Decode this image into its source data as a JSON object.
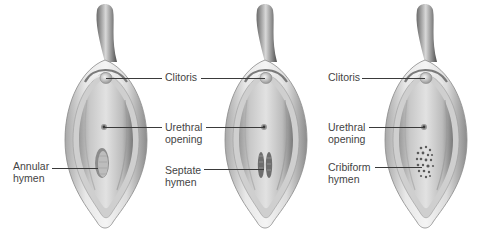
{
  "diagram": {
    "figures": [
      {
        "name": "annular",
        "hymen_type": "Annular hymen",
        "labels": {
          "clitoris": "",
          "urethral_line1": "",
          "urethral_line2": "",
          "hymen_line1": "Annular",
          "hymen_line2": "hymen"
        }
      },
      {
        "name": "septate",
        "hymen_type": "Septate hymen",
        "labels": {
          "clitoris": "Clitoris",
          "urethral_line1": "Urethral",
          "urethral_line2": "opening",
          "hymen_line1": "Septate",
          "hymen_line2": "hymen"
        }
      },
      {
        "name": "cribiform",
        "hymen_type": "Cribiform hymen",
        "labels": {
          "clitoris": "Clitoris",
          "urethral_line1": "Urethral",
          "urethral_line2": "opening",
          "hymen_line1": "Cribiform",
          "hymen_line2": "hymen"
        }
      }
    ],
    "colors": {
      "background": "#ffffff",
      "text": "#444444",
      "leader_line": "#3a3a3a",
      "tissue_light": "#e4e4e4",
      "tissue_mid": "#bdbdbd",
      "tissue_dark": "#6e6e6e"
    }
  }
}
